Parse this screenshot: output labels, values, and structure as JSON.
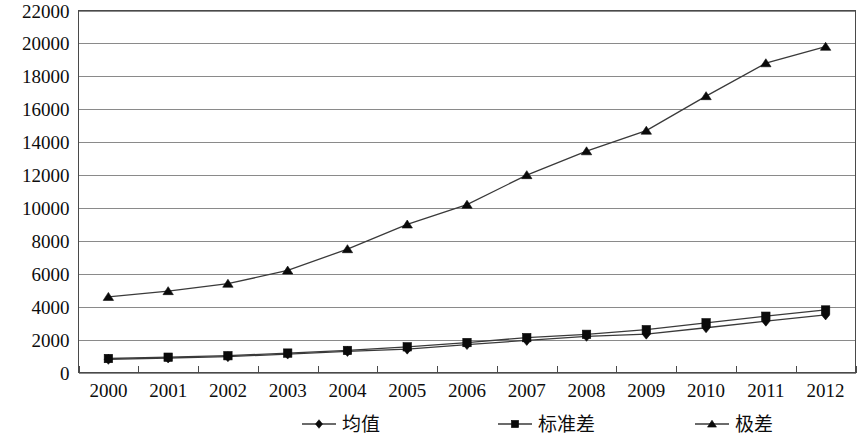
{
  "chart_data": {
    "type": "line",
    "title": "",
    "xlabel": "",
    "ylabel": "",
    "categories": [
      "2000",
      "2001",
      "2002",
      "2003",
      "2004",
      "2005",
      "2006",
      "2007",
      "2008",
      "2009",
      "2010",
      "2011",
      "2012"
    ],
    "x": [
      2000,
      2001,
      2002,
      2003,
      2004,
      2005,
      2006,
      2007,
      2008,
      2009,
      2010,
      2011,
      2012
    ],
    "ylim": [
      0,
      22000
    ],
    "y_ticks": [
      0,
      2000,
      4000,
      6000,
      8000,
      10000,
      12000,
      14000,
      16000,
      18000,
      20000,
      22000
    ],
    "y_tick_labels": [
      "0",
      "2000",
      "4000",
      "6000",
      "8000",
      "10000",
      "12000",
      "14000",
      "16000",
      "18000",
      "20000",
      "22000"
    ],
    "grid": true,
    "grid_axis": "y",
    "legend_position": "bottom",
    "series": [
      {
        "name": "均值",
        "marker": "diamond",
        "color": "#0a0a0a",
        "values": [
          800,
          880,
          960,
          1120,
          1280,
          1420,
          1700,
          1950,
          2200,
          2330,
          2720,
          3120,
          3500
        ]
      },
      {
        "name": "标准差",
        "marker": "square",
        "color": "#0a0a0a",
        "values": [
          850,
          930,
          1020,
          1180,
          1340,
          1560,
          1820,
          2120,
          2320,
          2600,
          3020,
          3420,
          3800
        ]
      },
      {
        "name": "极差",
        "marker": "triangle",
        "color": "#0a0a0a",
        "values": [
          4600,
          4950,
          5400,
          6200,
          7500,
          9000,
          10200,
          12000,
          13450,
          14700,
          16800,
          18800,
          19800
        ]
      }
    ]
  },
  "legend": {
    "items": [
      {
        "label": "均值",
        "marker": "diamond"
      },
      {
        "label": "标准差",
        "marker": "square"
      },
      {
        "label": "极差",
        "marker": "triangle"
      }
    ]
  }
}
